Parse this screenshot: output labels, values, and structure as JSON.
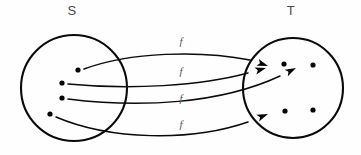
{
  "figure": {
    "type": "set-mapping-diagram",
    "width": 361,
    "height": 155,
    "background_color": "#fefefe",
    "stroke_color": "#0a0a0a",
    "label_color": "#4a4a4a"
  },
  "sets": [
    {
      "id": "domain",
      "label": "S",
      "label_x": 72,
      "label_y": 12,
      "center_x": 74,
      "center_y": 88,
      "radius": 53,
      "elements": [
        {
          "name": "s1",
          "x": 78,
          "y": 70
        },
        {
          "name": "s2",
          "x": 62,
          "y": 83
        },
        {
          "name": "s3",
          "x": 62,
          "y": 98
        },
        {
          "name": "s4",
          "x": 50,
          "y": 114
        }
      ]
    },
    {
      "id": "codomain",
      "label": "T",
      "label_x": 291,
      "label_y": 12,
      "center_x": 293,
      "center_y": 88,
      "radius": 50,
      "elements": [
        {
          "name": "t1",
          "x": 284,
          "y": 64
        },
        {
          "name": "t2",
          "x": 313,
          "y": 65
        },
        {
          "name": "t3",
          "x": 285,
          "y": 111
        },
        {
          "name": "t4",
          "x": 313,
          "y": 110
        }
      ]
    }
  ],
  "mappings": [
    {
      "id": "f1",
      "label": "f",
      "label_x": 181,
      "label_y": 42,
      "from": "s1",
      "to": "t1",
      "path": "M 84 69 C 130 52 200 50 250 60",
      "arrow_x": 268,
      "arrow_y": 66,
      "arrow_angle": 19
    },
    {
      "id": "f2",
      "label": "f",
      "label_x": 181,
      "label_y": 72,
      "from": "s2",
      "to": "t1",
      "path": "M 68 84 C 130 90 200 86 248 73",
      "arrow_x": 266,
      "arrow_y": 68,
      "arrow_angle": -16
    },
    {
      "id": "f3",
      "label": "f",
      "label_x": 181,
      "label_y": 99,
      "from": "s3",
      "to": "t2",
      "path": "M 68 99 C 140 108 220 104 280 76",
      "arrow_x": 296,
      "arrow_y": 68,
      "arrow_angle": -27
    },
    {
      "id": "f4",
      "label": "f",
      "label_x": 181,
      "label_y": 125,
      "from": "s4",
      "to": "t3",
      "path": "M 56 117 C 110 140 190 142 248 122",
      "arrow_x": 268,
      "arrow_y": 114,
      "arrow_angle": -22
    }
  ]
}
